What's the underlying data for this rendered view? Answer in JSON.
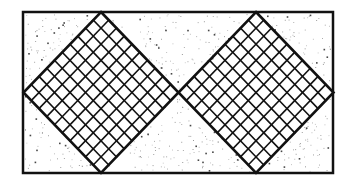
{
  "figure": {
    "width": 355,
    "height": 188,
    "background_color": "#ffffff",
    "line_color": "#111111",
    "stipple_color": "#555555",
    "frame": {
      "x": 23,
      "y": 12,
      "width": 310,
      "height": 161,
      "stroke_width": 2.5
    },
    "diamonds": [
      {
        "name": "left-diamond",
        "cx": 101,
        "cy": 92.5,
        "half_width": 77.5,
        "half_height": 80.5,
        "divisions": 10
      },
      {
        "name": "right-diamond",
        "cx": 256,
        "cy": 92.5,
        "half_width": 77.5,
        "half_height": 80.5,
        "divisions": 10
      }
    ],
    "stipple": {
      "dot_count": 900,
      "seed": 7
    }
  }
}
